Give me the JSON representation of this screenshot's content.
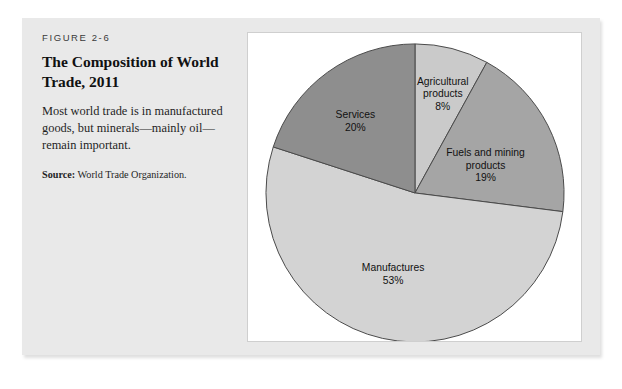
{
  "figure": {
    "number": "FIGURE 2-6",
    "title": "The Composition of World Trade, 2011",
    "caption": "Most world trade is in manufactured goods, but minerals—mainly oil—remain important.",
    "source_label": "Source:",
    "source_text": " World Trade Organization."
  },
  "chart_data": {
    "type": "pie",
    "title": "The Composition of World Trade, 2011",
    "start_angle_deg": 0,
    "direction": "clockwise",
    "legend": "none",
    "labels_inside": true,
    "categories": [
      "Agricultural products",
      "Fuels and mining products",
      "Manufactures",
      "Services"
    ],
    "values": [
      8,
      19,
      53,
      20
    ],
    "unit": "%",
    "colors": [
      "#cacaca",
      "#a5a5a5",
      "#d3d3d3",
      "#8e8e8e"
    ],
    "slices": [
      {
        "name": "Agricultural products",
        "value": 8,
        "value_label": "8%",
        "line1": "Agricultural",
        "line2": "products",
        "color": "#cacaca",
        "label_x": 196,
        "label_y": 52
      },
      {
        "name": "Fuels and mining products",
        "value": 19,
        "value_label": "19%",
        "line1": "Fuels and mining",
        "line2": "products",
        "color": "#a5a5a5",
        "label_x": 239,
        "label_y": 124
      },
      {
        "name": "Manufactures",
        "value": 53,
        "value_label": "53%",
        "line1": "Manufactures",
        "line2": "",
        "color": "#d3d3d3",
        "label_x": 146,
        "label_y": 240
      },
      {
        "name": "Services",
        "value": 20,
        "value_label": "20%",
        "line1": "Services",
        "line2": "",
        "color": "#8e8e8e",
        "label_x": 108,
        "label_y": 86
      }
    ],
    "outline_color": "#4a4a4a",
    "total": 100
  }
}
